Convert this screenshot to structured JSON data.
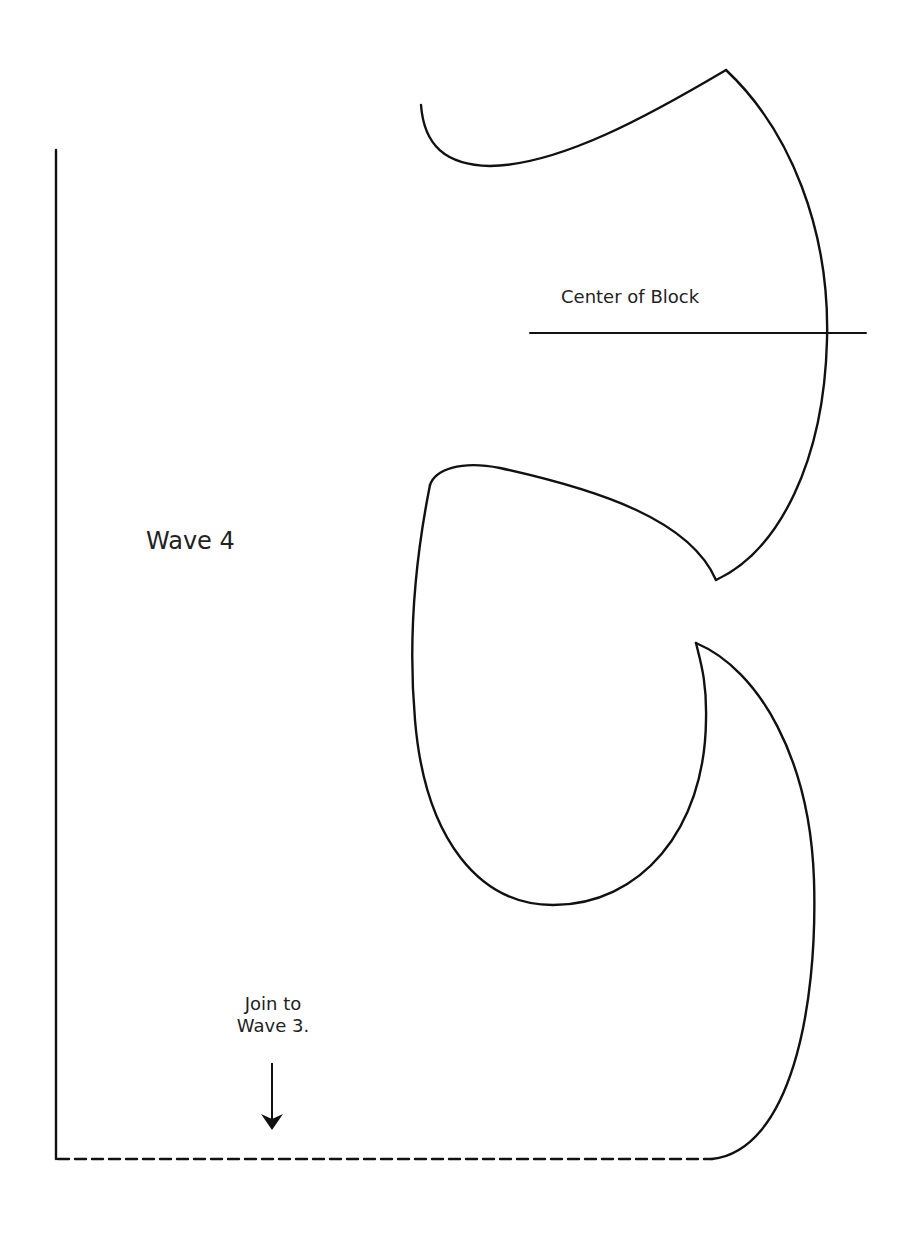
{
  "pattern": {
    "piece_label": "Wave 4",
    "center_label": "Center of Block",
    "join_note": {
      "line1": "Join to",
      "line2": "Wave 3."
    },
    "stroke_color": "#111111",
    "background": "#ffffff"
  },
  "icons": {
    "arrow": "down-arrow"
  }
}
